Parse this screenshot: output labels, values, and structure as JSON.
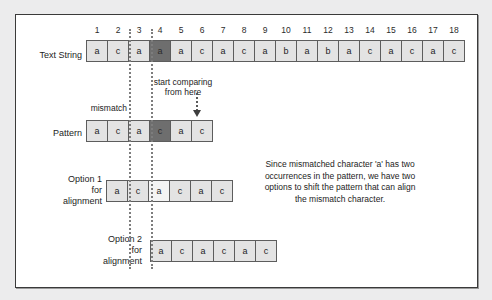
{
  "figure": {
    "rows": {
      "text_string": {
        "label": "Text String",
        "indices": [
          "1",
          "2",
          "3",
          "4",
          "5",
          "6",
          "7",
          "8",
          "9",
          "10",
          "11",
          "12",
          "13",
          "14",
          "15",
          "16",
          "17",
          "18"
        ],
        "cells": [
          "a",
          "c",
          "a",
          "a",
          "a",
          "c",
          "a",
          "c",
          "a",
          "b",
          "a",
          "b",
          "a",
          "c",
          "a",
          "c",
          "a",
          "c"
        ],
        "highlight_index": 4
      },
      "pattern": {
        "label": "Pattern",
        "cells": [
          "a",
          "c",
          "a",
          "c",
          "a",
          "c"
        ],
        "highlight_index": 4
      },
      "option1": {
        "label": "Option 1\nfor\nalignment",
        "cells": [
          "a",
          "c",
          "a",
          "c",
          "a",
          "c"
        ],
        "highlight_index": 3
      },
      "option2": {
        "label": "Option 2\nfor\nalignment",
        "cells": [
          "a",
          "c",
          "a",
          "c",
          "a",
          "c"
        ],
        "highlight_index": 0
      }
    },
    "annotations": {
      "start_comparing": "start comparing\nfrom here",
      "mismatch": "mismatch",
      "note": "Since mismatched character 'a' has two occurrences in the pattern, we have two options to shift the pattern that can align the mismatch character."
    },
    "colors": {
      "cell_fill": "#e3e3e3",
      "cell_highlight": "#6e6e6e",
      "cell_light": "#f4f4f4",
      "cell_border": "#5d5d5d",
      "guide_line": "#7d7d7d",
      "panel_border": "#3a3a3a",
      "page_background": "#ececed",
      "panel_background": "#ffffff"
    }
  }
}
